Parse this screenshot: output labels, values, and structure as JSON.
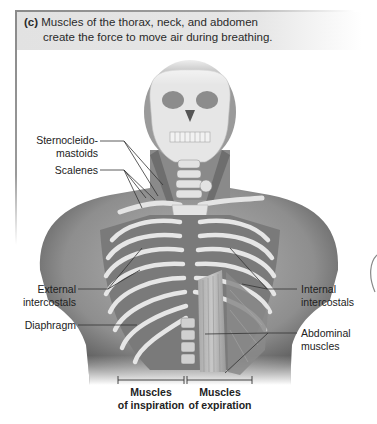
{
  "caption": {
    "tag": "(c)",
    "line1": "Muscles of the thorax, neck, and abdomen",
    "line2": "create the force to move air during breathing."
  },
  "labels": {
    "sternocleidomastoids_1": "Sternocleido-",
    "sternocleidomastoids_2": "mastoids",
    "scalenes": "Scalenes",
    "external_intercostals_1": "External",
    "external_intercostals_2": "intercostals",
    "diaphragm": "Diaphragm",
    "internal_intercostals_1": "Internal",
    "internal_intercostals_2": "intercostals",
    "abdominal_muscles_1": "Abdominal",
    "abdominal_muscles_2": "muscles"
  },
  "groups": {
    "inspiration_1": "Muscles",
    "inspiration_2": "of inspiration",
    "expiration_1": "Muscles",
    "expiration_2": "of expiration"
  },
  "colors": {
    "frame": "#8a8a8a",
    "caption_bg": "#e4e4e4",
    "skin": "#9a9a9a",
    "bone": "#e8e8e8",
    "muscle": "#7e7e7e",
    "leader_line": "#333333"
  }
}
